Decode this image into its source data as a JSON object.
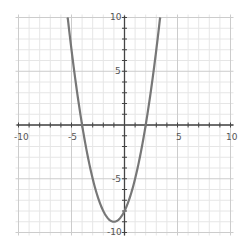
{
  "chart_data": {
    "type": "line",
    "title": "",
    "xlabel": "",
    "ylabel": "",
    "xlim": [
      -10,
      10
    ],
    "ylim": [
      -10,
      10
    ],
    "grid": true,
    "minor_grid_step": 1,
    "major_grid_step": 5,
    "x_tick_labels": [
      "-10",
      "-5",
      "5",
      "10"
    ],
    "y_tick_labels": [
      "10",
      "5",
      "-5",
      "-10"
    ],
    "series": [
      {
        "name": "y = x^2 + 2x - 8",
        "color": "#777777",
        "expression": "x^2 + 2x - 8",
        "x_intercepts": [
          -4,
          2
        ],
        "y_intercept": -8,
        "vertex": [
          -1,
          -9
        ],
        "x": [
          -5.4,
          -5,
          -4.5,
          -4,
          -3.5,
          -3,
          -2.5,
          -2,
          -1.5,
          -1,
          -0.5,
          0,
          0.5,
          1,
          1.5,
          2,
          2.5,
          3,
          3.4
        ],
        "values": [
          10.36,
          7,
          3.25,
          0,
          -2.75,
          -5,
          -6.75,
          -8,
          -8.75,
          -9,
          -8.75,
          -8,
          -6.75,
          -5,
          -2.75,
          0,
          3.25,
          7,
          10.36
        ]
      }
    ]
  },
  "colors": {
    "background": "#ffffff",
    "minor_grid": "#e6e6e6",
    "major_grid": "#cccccc",
    "axis": "#444444",
    "curve": "#777777",
    "label": "#555555"
  }
}
